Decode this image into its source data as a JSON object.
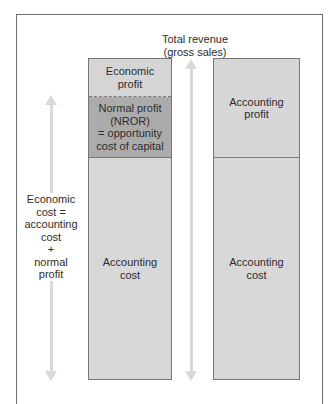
{
  "diagram": {
    "title": "Total revenue\n(gross sales)",
    "left_column": {
      "segments": [
        {
          "label": "Economic\nprofit",
          "fill": "#d5d5d5"
        },
        {
          "label": "Normal profit\n(NROR)\n= opportunity\ncost of capital",
          "fill": "#ababab"
        },
        {
          "label": "Accounting\ncost",
          "fill": "#d8d8d8"
        }
      ]
    },
    "right_column": {
      "segments": [
        {
          "label": "Accounting\nprofit",
          "fill": "#d6d6d6"
        },
        {
          "label": "Accounting\ncost",
          "fill": "#d8d8d8"
        }
      ]
    },
    "side_label": "Economic\ncost =\naccounting\ncost\n+\nnormal\nprofit",
    "arrows": [
      {
        "name": "economic-cost-span",
        "direction": "double"
      },
      {
        "name": "total-revenue-span",
        "direction": "double"
      }
    ],
    "colors": {
      "border": "#777777",
      "arrow": "#d9d9d9",
      "dashed_divider": "#7a7a7a"
    }
  }
}
